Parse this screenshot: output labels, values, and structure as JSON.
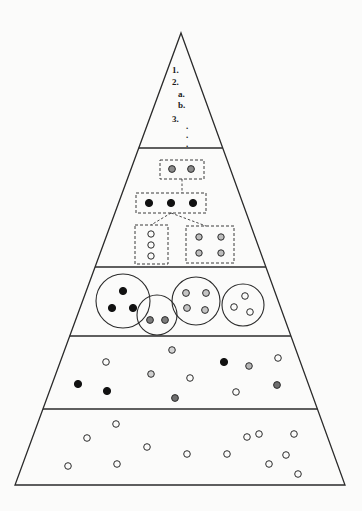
{
  "figure": {
    "type": "pyramid-hierarchy-diagram",
    "background_color": "#fbfbfa",
    "stroke_color": "#2b2b2b",
    "apex": {
      "x": 181,
      "y": 33
    },
    "base": {
      "left_x": 15,
      "right_x": 345,
      "y": 485
    },
    "tier_dividers_y": [
      148,
      267,
      336,
      409
    ]
  },
  "tiers": [
    {
      "index": 1,
      "name": "apex-outline-tier",
      "content_type": "numbered-outline-text",
      "top_y": 33,
      "bottom_y": 148
    },
    {
      "index": 2,
      "name": "dashed-box-tree-tier",
      "content_type": "dashed-boxes-with-connectors",
      "top_y": 148,
      "bottom_y": 267
    },
    {
      "index": 3,
      "name": "grouped-circles-tier",
      "content_type": "circle-clusters",
      "top_y": 267,
      "bottom_y": 336
    },
    {
      "index": 4,
      "name": "mixed-scatter-tier",
      "content_type": "scattered-mixed-dots",
      "top_y": 336,
      "bottom_y": 409
    },
    {
      "index": 5,
      "name": "hollow-scatter-tier",
      "content_type": "scattered-hollow-dots",
      "top_y": 409,
      "bottom_y": 485
    }
  ],
  "apex_outline": {
    "lines": [
      {
        "label": "1.",
        "x": 172,
        "y": 66
      },
      {
        "label": "2.",
        "x": 172,
        "y": 78
      },
      {
        "label": "a.",
        "x": 178,
        "y": 90
      },
      {
        "label": "b.",
        "x": 178,
        "y": 101
      },
      {
        "label": "3.",
        "x": 172,
        "y": 115
      },
      {
        "label": ".",
        "x": 186,
        "y": 122
      },
      {
        "label": ".",
        "x": 186,
        "y": 131
      },
      {
        "label": ".",
        "x": 186,
        "y": 140
      }
    ]
  },
  "dashed_boxes": [
    {
      "name": "top-dashed-box",
      "x": 160,
      "y": 160,
      "width": 44,
      "height": 19,
      "dots": [
        {
          "cx": 172,
          "cy": 169,
          "r": 3.4,
          "fill": "#8c8c8c",
          "stroke": "#2b2b2b"
        },
        {
          "cx": 191,
          "cy": 169,
          "r": 3.4,
          "fill": "#8c8c8c",
          "stroke": "#2b2b2b"
        }
      ]
    },
    {
      "name": "middle-dashed-box",
      "x": 136,
      "y": 193,
      "width": 70,
      "height": 20,
      "dots": [
        {
          "cx": 149,
          "cy": 203,
          "r": 3.6,
          "fill": "#111111",
          "stroke": "#111111"
        },
        {
          "cx": 171,
          "cy": 203,
          "r": 3.6,
          "fill": "#111111",
          "stroke": "#111111"
        },
        {
          "cx": 193,
          "cy": 203,
          "r": 3.6,
          "fill": "#111111",
          "stroke": "#111111"
        }
      ]
    },
    {
      "name": "lower-left-dashed-box",
      "x": 135,
      "y": 225,
      "width": 33,
      "height": 39,
      "dots": [
        {
          "cx": 151,
          "cy": 234,
          "r": 3.2,
          "fill": "#fbfbfa",
          "stroke": "#2b2b2b"
        },
        {
          "cx": 151,
          "cy": 245,
          "r": 3.2,
          "fill": "#fbfbfa",
          "stroke": "#2b2b2b"
        },
        {
          "cx": 151,
          "cy": 256,
          "r": 3.2,
          "fill": "#fbfbfa",
          "stroke": "#2b2b2b"
        }
      ]
    },
    {
      "name": "lower-right-dashed-box",
      "x": 186,
      "y": 226,
      "width": 48,
      "height": 37,
      "dots": [
        {
          "cx": 199,
          "cy": 237,
          "r": 3.2,
          "fill": "#bdbdbd",
          "stroke": "#2b2b2b"
        },
        {
          "cx": 221,
          "cy": 237,
          "r": 3.2,
          "fill": "#bdbdbd",
          "stroke": "#2b2b2b"
        },
        {
          "cx": 199,
          "cy": 253,
          "r": 3.2,
          "fill": "#bdbdbd",
          "stroke": "#2b2b2b"
        },
        {
          "cx": 221,
          "cy": 253,
          "r": 3.2,
          "fill": "#bdbdbd",
          "stroke": "#2b2b2b"
        }
      ]
    }
  ],
  "connectors": [
    {
      "name": "top-to-middle-connector",
      "points": "182,179 182,193"
    },
    {
      "name": "middle-to-left-connector",
      "points": "171,213 151,225"
    },
    {
      "name": "middle-to-right-connector",
      "points": "171,213 206,226"
    }
  ],
  "circle_clusters": [
    {
      "name": "cluster-black-three",
      "cx": 123,
      "cy": 301,
      "r": 27,
      "dots": [
        {
          "cx": 123,
          "cy": 291,
          "r": 3.6,
          "fill": "#111111",
          "stroke": "#111111"
        },
        {
          "cx": 112,
          "cy": 308,
          "r": 3.6,
          "fill": "#111111",
          "stroke": "#111111"
        },
        {
          "cx": 133,
          "cy": 308,
          "r": 3.6,
          "fill": "#111111",
          "stroke": "#111111"
        }
      ]
    },
    {
      "name": "cluster-gray-two",
      "cx": 157,
      "cy": 315,
      "r": 20,
      "dots": [
        {
          "cx": 150,
          "cy": 320,
          "r": 3.4,
          "fill": "#7d7d7d",
          "stroke": "#2b2b2b"
        },
        {
          "cx": 165,
          "cy": 320,
          "r": 3.4,
          "fill": "#7d7d7d",
          "stroke": "#2b2b2b"
        }
      ]
    },
    {
      "name": "cluster-gray-four",
      "cx": 196,
      "cy": 301,
      "r": 24,
      "dots": [
        {
          "cx": 186,
          "cy": 293,
          "r": 3.4,
          "fill": "#c4c4c4",
          "stroke": "#2b2b2b"
        },
        {
          "cx": 206,
          "cy": 293,
          "r": 3.4,
          "fill": "#c4c4c4",
          "stroke": "#2b2b2b"
        },
        {
          "cx": 187,
          "cy": 308,
          "r": 3.4,
          "fill": "#c4c4c4",
          "stroke": "#2b2b2b"
        },
        {
          "cx": 205,
          "cy": 310,
          "r": 3.4,
          "fill": "#c4c4c4",
          "stroke": "#2b2b2b"
        }
      ]
    },
    {
      "name": "cluster-hollow-three",
      "cx": 243,
      "cy": 305,
      "r": 21,
      "dots": [
        {
          "cx": 245,
          "cy": 296,
          "r": 3.3,
          "fill": "#fbfbfa",
          "stroke": "#2b2b2b"
        },
        {
          "cx": 234,
          "cy": 307,
          "r": 3.3,
          "fill": "#fbfbfa",
          "stroke": "#2b2b2b"
        },
        {
          "cx": 250,
          "cy": 312,
          "r": 3.3,
          "fill": "#fbfbfa",
          "stroke": "#2b2b2b"
        }
      ]
    }
  ],
  "scatter_tier_four": [
    {
      "cx": 78,
      "cy": 384,
      "r": 3.6,
      "fill": "#111111",
      "stroke": "#111111"
    },
    {
      "cx": 107,
      "cy": 391,
      "r": 3.6,
      "fill": "#111111",
      "stroke": "#111111"
    },
    {
      "cx": 106,
      "cy": 362,
      "r": 3.3,
      "fill": "#fbfbfa",
      "stroke": "#2b2b2b"
    },
    {
      "cx": 151,
      "cy": 374,
      "r": 3.3,
      "fill": "#cfcfcf",
      "stroke": "#2b2b2b"
    },
    {
      "cx": 172,
      "cy": 350,
      "r": 3.3,
      "fill": "#d4d4d4",
      "stroke": "#2b2b2b"
    },
    {
      "cx": 190,
      "cy": 378,
      "r": 3.3,
      "fill": "#fbfbfa",
      "stroke": "#2b2b2b"
    },
    {
      "cx": 175,
      "cy": 398,
      "r": 3.4,
      "fill": "#6f6f6f",
      "stroke": "#2b2b2b"
    },
    {
      "cx": 224,
      "cy": 362,
      "r": 3.6,
      "fill": "#111111",
      "stroke": "#111111"
    },
    {
      "cx": 249,
      "cy": 366,
      "r": 3.3,
      "fill": "#b5b5b5",
      "stroke": "#2b2b2b"
    },
    {
      "cx": 236,
      "cy": 392,
      "r": 3.3,
      "fill": "#fbfbfa",
      "stroke": "#2b2b2b"
    },
    {
      "cx": 278,
      "cy": 358,
      "r": 3.3,
      "fill": "#fbfbfa",
      "stroke": "#2b2b2b"
    },
    {
      "cx": 277,
      "cy": 385,
      "r": 3.4,
      "fill": "#6f6f6f",
      "stroke": "#2b2b2b"
    }
  ],
  "scatter_tier_five": [
    {
      "cx": 68,
      "cy": 466,
      "r": 3.3,
      "fill": "#fbfbfa",
      "stroke": "#2b2b2b"
    },
    {
      "cx": 87,
      "cy": 438,
      "r": 3.3,
      "fill": "#fbfbfa",
      "stroke": "#2b2b2b"
    },
    {
      "cx": 116,
      "cy": 424,
      "r": 3.3,
      "fill": "#fbfbfa",
      "stroke": "#2b2b2b"
    },
    {
      "cx": 117,
      "cy": 464,
      "r": 3.3,
      "fill": "#fbfbfa",
      "stroke": "#2b2b2b"
    },
    {
      "cx": 147,
      "cy": 447,
      "r": 3.3,
      "fill": "#fbfbfa",
      "stroke": "#2b2b2b"
    },
    {
      "cx": 187,
      "cy": 454,
      "r": 3.3,
      "fill": "#fbfbfa",
      "stroke": "#2b2b2b"
    },
    {
      "cx": 227,
      "cy": 454,
      "r": 3.3,
      "fill": "#fbfbfa",
      "stroke": "#2b2b2b"
    },
    {
      "cx": 259,
      "cy": 434,
      "r": 3.3,
      "fill": "#fbfbfa",
      "stroke": "#2b2b2b"
    },
    {
      "cx": 269,
      "cy": 464,
      "r": 3.3,
      "fill": "#fbfbfa",
      "stroke": "#2b2b2b"
    },
    {
      "cx": 247,
      "cy": 437,
      "r": 3.3,
      "fill": "#fbfbfa",
      "stroke": "#2b2b2b"
    },
    {
      "cx": 286,
      "cy": 455,
      "r": 3.3,
      "fill": "#fbfbfa",
      "stroke": "#2b2b2b"
    },
    {
      "cx": 294,
      "cy": 434,
      "r": 3.3,
      "fill": "#fbfbfa",
      "stroke": "#2b2b2b"
    },
    {
      "cx": 298,
      "cy": 474,
      "r": 3.3,
      "fill": "#fbfbfa",
      "stroke": "#2b2b2b"
    }
  ]
}
